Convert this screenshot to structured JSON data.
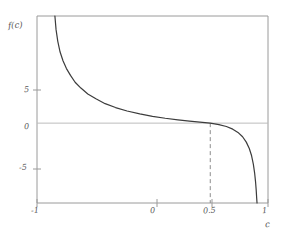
{
  "chart_data": {
    "type": "line",
    "title": "",
    "subtitle": "",
    "xlabel": "c",
    "ylabel": "f(c)",
    "xlim": [
      -1,
      1
    ],
    "ylim": [
      -8.2,
      11.0
    ],
    "grid": false,
    "legend": null,
    "xticks": [
      {
        "value": -1,
        "label": "-1"
      },
      {
        "value": 0,
        "label": "0"
      },
      {
        "value": 0.5,
        "label": "0.5"
      },
      {
        "value": 1,
        "label": "1"
      }
    ],
    "yticks": [
      {
        "value": 5,
        "label": "5"
      },
      {
        "value": 0,
        "label": "0"
      },
      {
        "value": -5,
        "label": "-5"
      }
    ],
    "annotations": [
      {
        "name": "zero-crossing-marker",
        "type": "vertical-dashed-line",
        "x": 0.5,
        "y_from": 0,
        "y_to": -8.2,
        "label": "0.5"
      },
      {
        "name": "zero-reference-line",
        "type": "horizontal-line",
        "y": 0
      }
    ],
    "series": [
      {
        "name": "f(c)",
        "color": "#3c3c3c",
        "points": [
          {
            "x": -0.845,
            "y": 11.0
          },
          {
            "x": -0.835,
            "y": 9.6
          },
          {
            "x": -0.82,
            "y": 8.4
          },
          {
            "x": -0.8,
            "y": 7.3
          },
          {
            "x": -0.775,
            "y": 6.4
          },
          {
            "x": -0.745,
            "y": 5.6
          },
          {
            "x": -0.71,
            "y": 4.9
          },
          {
            "x": -0.67,
            "y": 4.2
          },
          {
            "x": -0.62,
            "y": 3.6
          },
          {
            "x": -0.56,
            "y": 3.0
          },
          {
            "x": -0.49,
            "y": 2.5
          },
          {
            "x": -0.41,
            "y": 2.0
          },
          {
            "x": -0.32,
            "y": 1.6
          },
          {
            "x": -0.22,
            "y": 1.25
          },
          {
            "x": -0.11,
            "y": 0.95
          },
          {
            "x": 0.0,
            "y": 0.7
          },
          {
            "x": 0.11,
            "y": 0.5
          },
          {
            "x": 0.22,
            "y": 0.33
          },
          {
            "x": 0.32,
            "y": 0.2
          },
          {
            "x": 0.41,
            "y": 0.1
          },
          {
            "x": 0.5,
            "y": 0.0
          },
          {
            "x": 0.575,
            "y": -0.15
          },
          {
            "x": 0.64,
            "y": -0.35
          },
          {
            "x": 0.695,
            "y": -0.62
          },
          {
            "x": 0.74,
            "y": -0.95
          },
          {
            "x": 0.78,
            "y": -1.4
          },
          {
            "x": 0.812,
            "y": -1.95
          },
          {
            "x": 0.838,
            "y": -2.6
          },
          {
            "x": 0.858,
            "y": -3.35
          },
          {
            "x": 0.873,
            "y": -4.2
          },
          {
            "x": 0.884,
            "y": -5.1
          },
          {
            "x": 0.892,
            "y": -6.0
          },
          {
            "x": 0.898,
            "y": -6.9
          },
          {
            "x": 0.902,
            "y": -7.7
          },
          {
            "x": 0.905,
            "y": -8.2
          }
        ]
      }
    ]
  },
  "labels": {
    "ylabel": "f(c)",
    "xlabel": "c",
    "ytick_5": "5",
    "ytick_0": "0",
    "ytick_m5": "-5",
    "xtick_m1": "-1",
    "xtick_0": "0",
    "xtick_05": "0.5",
    "xtick_1": "1"
  },
  "colors": {
    "curve": "#3c3c3c",
    "frame": "#9a9a9a",
    "zero_line": "#bdbdbd",
    "dashed": "#8c8c8c",
    "text": "#5a5a5a",
    "background": "#ffffff"
  }
}
